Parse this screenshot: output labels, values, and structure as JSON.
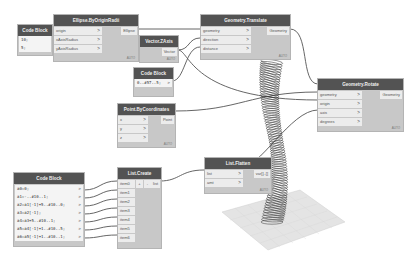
{
  "nodes": {
    "code_block_small": {
      "title": "Code Block",
      "lines": [
        "10;",
        "5;"
      ]
    },
    "ellipse": {
      "title": "Ellipse.ByOriginRadii",
      "inputs": [
        "origin",
        "xAxisRadius",
        "yAxisRadius"
      ],
      "output": "Ellipse"
    },
    "vector_zaxis": {
      "title": "Vector.ZAxis",
      "output": "Vector"
    },
    "code_block_range": {
      "title": "Code Block",
      "lines": [
        "0..#57..5;"
      ]
    },
    "geometry_translate": {
      "title": "Geometry.Translate",
      "inputs": [
        "geometry",
        "direction",
        "distance"
      ],
      "output": "Geometry"
    },
    "point_bycoords": {
      "title": "Point.ByCoordinates",
      "inputs": [
        "x",
        "y",
        "z"
      ],
      "output": "Point"
    },
    "geometry_rotate": {
      "title": "Geometry.Rotate",
      "inputs": [
        "geometry",
        "origin",
        "axis",
        "degrees"
      ],
      "output": "Geometry"
    },
    "code_block_big": {
      "title": "Code Block",
      "lines": [
        "a0=0;",
        "a1=-..#10..1;",
        "a2=a1[-1]+5..#10..0;",
        "a3=a2[-1];",
        "a4=a3+5..#10..1;",
        "a5=a4[-1]+1..#10..5;",
        "a6=a5[-1]+1..#10..1;"
      ]
    },
    "list_create": {
      "title": "List.Create",
      "inputs": [
        "item0",
        "item1",
        "item2",
        "item3",
        "item4",
        "item5",
        "item6"
      ],
      "add": "+",
      "remove": "-",
      "output": "list"
    },
    "list_flatten": {
      "title": "List.Flatten",
      "inputs": [
        "list",
        "amt"
      ],
      "output": "var[]..[]"
    }
  },
  "footer_label": "AUTO",
  "chevron": ">"
}
